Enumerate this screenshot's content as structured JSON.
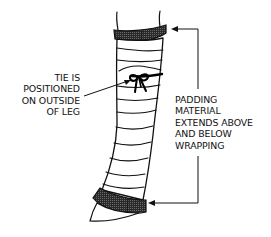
{
  "diagram": {
    "labels": {
      "tie": {
        "lines": [
          "TIE IS",
          "POSITIONED",
          "ON OUTSIDE",
          "OF LEG"
        ]
      },
      "padding": {
        "lines": [
          "PADDING",
          "MATERIAL",
          "EXTENDS ABOVE",
          "AND BELOW",
          "WRAPPING"
        ]
      }
    },
    "colors": {
      "line": "#111111",
      "padding_fill": "#3a3a3a",
      "background": "#ffffff"
    }
  }
}
